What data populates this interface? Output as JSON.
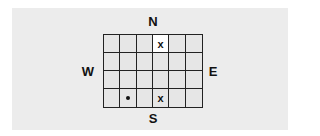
{
  "compass": {
    "north": "N",
    "south": "S",
    "west": "W",
    "east": "E"
  },
  "grid": {
    "columns": 6,
    "rows": 4,
    "cells": [
      [
        {
          "mark": ""
        },
        {
          "mark": ""
        },
        {
          "mark": ""
        },
        {
          "mark": "x",
          "highlight": true
        },
        {
          "mark": ""
        },
        {
          "mark": ""
        }
      ],
      [
        {
          "mark": ""
        },
        {
          "mark": ""
        },
        {
          "mark": ""
        },
        {
          "mark": ""
        },
        {
          "mark": ""
        },
        {
          "mark": ""
        }
      ],
      [
        {
          "mark": ""
        },
        {
          "mark": ""
        },
        {
          "mark": ""
        },
        {
          "mark": ""
        },
        {
          "mark": ""
        },
        {
          "mark": ""
        }
      ],
      [
        {
          "mark": ""
        },
        {
          "mark": "dot"
        },
        {
          "mark": ""
        },
        {
          "mark": "x"
        },
        {
          "mark": ""
        },
        {
          "mark": ""
        }
      ]
    ]
  },
  "colors": {
    "panel": "#ececec",
    "cell": "#e6e6e6",
    "highlight": "#ffffff",
    "line": "#222222"
  }
}
